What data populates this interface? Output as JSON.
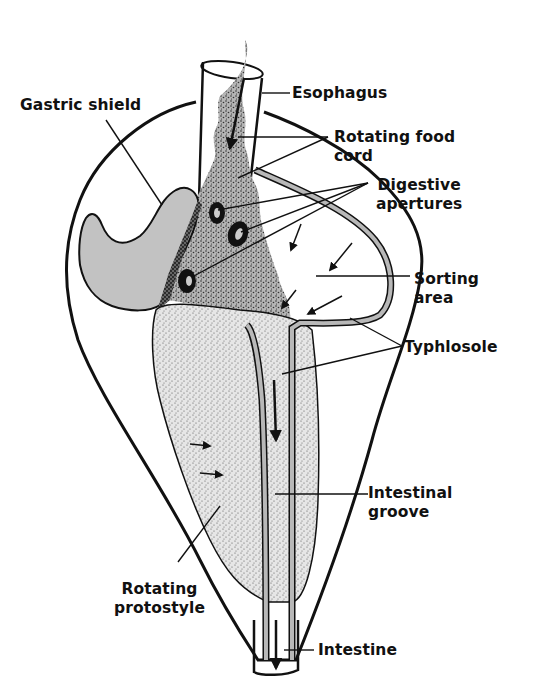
{
  "colors": {
    "outline": "#111111",
    "shield_fill": "#c2c2c2",
    "food_cord_fill": "#9a9a9a",
    "protostyle_fill": "#d8d8d8",
    "typhlosole_fill": "#b8b8b8",
    "aperture": "#111111"
  },
  "labels": {
    "esophagus": {
      "lines": [
        "Esophagus"
      ]
    },
    "gastric_shield": {
      "lines": [
        "Gastric shield"
      ]
    },
    "rotating_food_cord": {
      "lines": [
        "Rotating food",
        "cord"
      ]
    },
    "digestive_apertures": {
      "lines": [
        "Digestive",
        "apertures"
      ]
    },
    "sorting_area": {
      "lines": [
        "Sorting",
        "area"
      ]
    },
    "typhlosole": {
      "lines": [
        "Typhlosole"
      ]
    },
    "intestinal_groove": {
      "lines": [
        "Intestinal",
        "groove"
      ]
    },
    "rotating_protostyle": {
      "lines": [
        "Rotating",
        "protostyle"
      ]
    },
    "intestine": {
      "lines": [
        "Intestine"
      ]
    }
  }
}
